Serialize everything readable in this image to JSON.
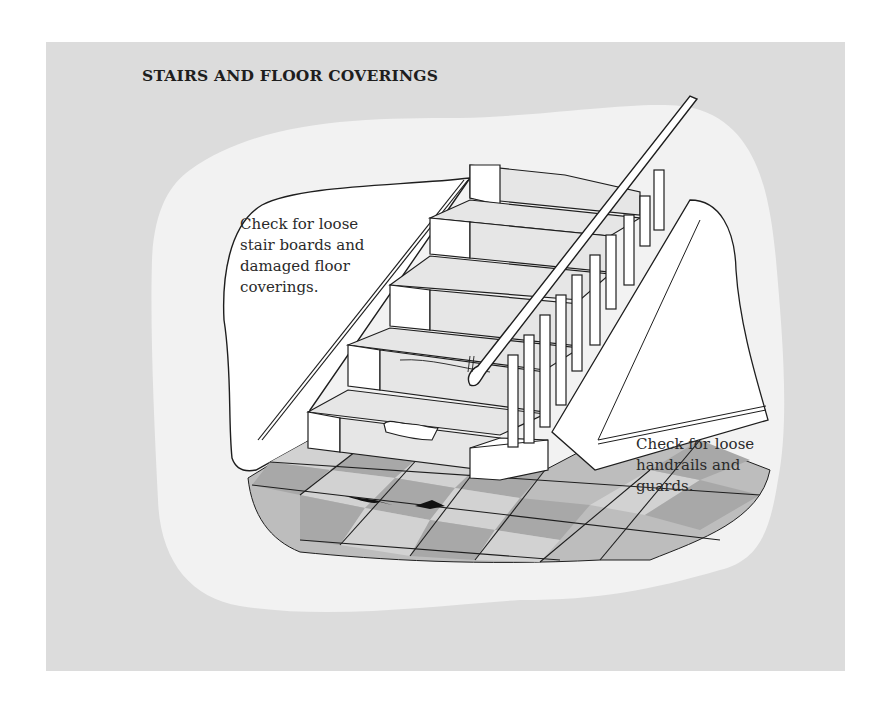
{
  "title": "STAIRS AND FLOOR COVERINGS",
  "callouts": [
    {
      "id": "stair-boards",
      "text": "Check for loose\nstair boards and\ndamaged floor\ncoverings."
    },
    {
      "id": "handrails",
      "text": "Check for loose\nhandrails and\nguards."
    }
  ],
  "colors": {
    "panel_bg": "#dcdcdc",
    "blob_bg": "#f2f2f2",
    "line": "#1e1e1e",
    "tread_tint": "#e6e6e6",
    "tile_light": "#cfcfcf",
    "tile_dark": "#a9a9a9"
  },
  "illustration": {
    "subject": "staircase with carpet runner, balusters and handrail over tiled floor",
    "hazards": [
      "torn stair carpet",
      "lifting floor tiles",
      "loose handrail"
    ]
  }
}
